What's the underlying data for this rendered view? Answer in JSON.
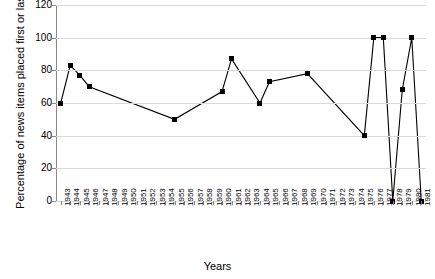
{
  "chart_data": {
    "type": "line",
    "title": "",
    "xlabel": "Years",
    "ylabel": "Percentage of news items placed first or last",
    "ylim": [
      0,
      120
    ],
    "ytick_step": 20,
    "yticks": [
      0,
      20,
      40,
      60,
      80,
      100,
      120
    ],
    "grid": true,
    "legend": "none",
    "marker": "filled-square",
    "line_color": "#000000",
    "grid_color": "#d9d9d9",
    "axis_color": "#8a8a8a",
    "categories": [
      "1943",
      "1944",
      "1945",
      "1946",
      "1947",
      "1948",
      "1949",
      "1950",
      "1951",
      "1952",
      "1953",
      "1954",
      "1955",
      "1956",
      "1957",
      "1958",
      "1959",
      "1960",
      "1961",
      "1962",
      "1963",
      "1964",
      "1965",
      "1966",
      "1967",
      "1968",
      "1969",
      "1970",
      "1971",
      "1972",
      "1973",
      "1974",
      "1975",
      "1976",
      "1977",
      "1978",
      "1979",
      "1980",
      "1981"
    ],
    "points": [
      {
        "x": "1943",
        "y": 60
      },
      {
        "x": "1944",
        "y": 83
      },
      {
        "x": "1945",
        "y": 77
      },
      {
        "x": "1946",
        "y": 70
      },
      {
        "x": "1955",
        "y": 50
      },
      {
        "x": "1960",
        "y": 67
      },
      {
        "x": "1961",
        "y": 87
      },
      {
        "x": "1964",
        "y": 60
      },
      {
        "x": "1965",
        "y": 73
      },
      {
        "x": "1969",
        "y": 78
      },
      {
        "x": "1975",
        "y": 40
      },
      {
        "x": "1976",
        "y": 100
      },
      {
        "x": "1977",
        "y": 100
      },
      {
        "x": "1978",
        "y": 0
      },
      {
        "x": "1979",
        "y": 68
      },
      {
        "x": "1980",
        "y": 100
      },
      {
        "x": "1981",
        "y": 0
      }
    ]
  }
}
